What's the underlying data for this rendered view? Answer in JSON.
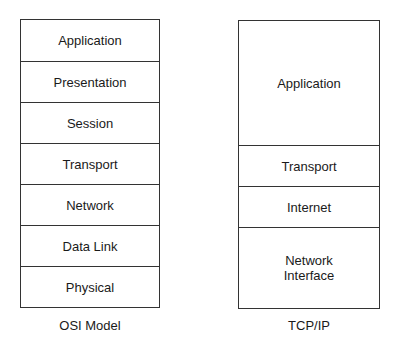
{
  "osi": {
    "caption": "OSI Model",
    "layers": [
      "Application",
      "Presentation",
      "Session",
      "Transport",
      "Network",
      "Data Link",
      "Physical"
    ]
  },
  "tcpip": {
    "caption": "TCP/IP",
    "layers": [
      "Application",
      "Transport",
      "Internet",
      "Network\nInterface"
    ]
  }
}
